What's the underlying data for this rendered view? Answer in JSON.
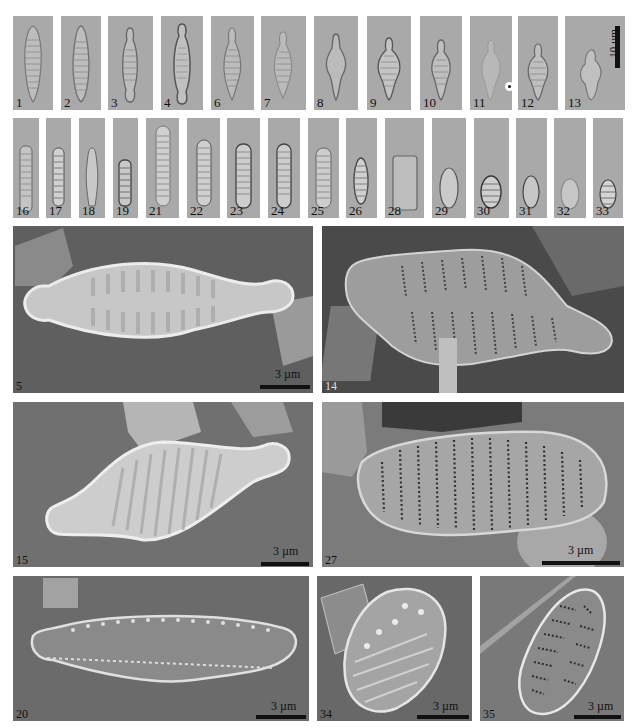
{
  "figure": {
    "lm_row1": [
      {
        "label": "1",
        "x": 13,
        "w": 40,
        "shape": "lanceolate"
      },
      {
        "label": "2",
        "x": 61,
        "w": 40,
        "shape": "lanceolate"
      },
      {
        "label": "3",
        "x": 108,
        "w": 45,
        "shape": "capitate"
      },
      {
        "label": "4",
        "x": 161,
        "w": 42,
        "shape": "capitate"
      },
      {
        "label": "6",
        "x": 211,
        "w": 43,
        "shape": "rhombic"
      },
      {
        "label": "7",
        "x": 261,
        "w": 45,
        "shape": "rhombic"
      },
      {
        "label": "8",
        "x": 314,
        "w": 44,
        "shape": "rhombic"
      },
      {
        "label": "9",
        "x": 367,
        "w": 44,
        "shape": "rhombic-capitate"
      },
      {
        "label": "10",
        "x": 420,
        "w": 42,
        "shape": "rhombic-capitate"
      },
      {
        "label": "11",
        "x": 470,
        "w": 42,
        "shape": "rhombic-capitate"
      },
      {
        "label": "12",
        "x": 518,
        "w": 40,
        "shape": "rhombic-capitate"
      },
      {
        "label": "13",
        "x": 565,
        "w": 60,
        "shape": "irregular"
      }
    ],
    "lm_row2": [
      {
        "label": "16",
        "x": 13,
        "w": 26
      },
      {
        "label": "17",
        "x": 46,
        "w": 25
      },
      {
        "label": "18",
        "x": 79,
        "w": 26
      },
      {
        "label": "19",
        "x": 113,
        "w": 25
      },
      {
        "label": "21",
        "x": 146,
        "w": 33
      },
      {
        "label": "22",
        "x": 187,
        "w": 33
      },
      {
        "label": "23",
        "x": 227,
        "w": 33
      },
      {
        "label": "24",
        "x": 268,
        "w": 32
      },
      {
        "label": "25",
        "x": 308,
        "w": 31
      },
      {
        "label": "26",
        "x": 346,
        "w": 31
      },
      {
        "label": "28",
        "x": 385,
        "w": 39
      },
      {
        "label": "29",
        "x": 432,
        "w": 34
      },
      {
        "label": "30",
        "x": 474,
        "w": 35
      },
      {
        "label": "31",
        "x": 516,
        "w": 31
      },
      {
        "label": "32",
        "x": 554,
        "w": 32
      },
      {
        "label": "33",
        "x": 593,
        "w": 30
      }
    ],
    "lm_scale_bar": "10 µm",
    "sem_panels": [
      {
        "label": "5",
        "scale": "3 µm"
      },
      {
        "label": "14",
        "scale": ""
      },
      {
        "label": "15",
        "scale": "3 µm"
      },
      {
        "label": "27",
        "scale": "3 µm"
      },
      {
        "label": "20",
        "scale": "3 µm"
      },
      {
        "label": "34",
        "scale": "3 µm"
      },
      {
        "label": "35",
        "scale": "3 µm"
      }
    ]
  }
}
